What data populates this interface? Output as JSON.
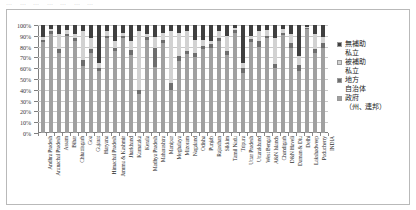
{
  "top_strip_text": "⋯ ⋯ ⋯ ⋯ ⋯ ⋯ ⋯",
  "legend": {
    "position": "right",
    "items": [
      {
        "label": "無補助\n私立",
        "color": "#3f3f3f",
        "name": "unaided-private"
      },
      {
        "label": "被補助\n私立",
        "color": "#d2d2d2",
        "name": "aided-private"
      },
      {
        "label": "地方\n自治体",
        "color": "#6e6e6e",
        "name": "local-body"
      },
      {
        "label": "政府\n（州、連邦）",
        "color": "#a0a0a0",
        "name": "government-state-union"
      }
    ]
  },
  "chart_data": {
    "type": "bar",
    "stacked": true,
    "normalized_percent": true,
    "title": "",
    "xlabel": "",
    "ylabel": "",
    "ylim": [
      0,
      100
    ],
    "grid": true,
    "ytick_labels": [
      "100%",
      "90%",
      "80%",
      "70%",
      "60%",
      "50%",
      "40%",
      "30%",
      "20%",
      "10%",
      "0%"
    ],
    "ytick_values": [
      100,
      90,
      80,
      70,
      60,
      50,
      40,
      30,
      20,
      10,
      0
    ],
    "series_order_bottom_to_top": [
      "政府（州、連邦）",
      "地方自治体",
      "被補助私立",
      "無補助私立"
    ],
    "categories": [
      "Andhra Pradesh",
      "Arunachal Pradesh",
      "Assam",
      "Bihar",
      "Chhattisgarh",
      "Goa",
      "Gujarat",
      "Haryana",
      "Himachal Pradesh",
      "Jammu & Kashmir",
      "Jharkhand",
      "Karnataka",
      "Kerala",
      "Madhya Pradesh",
      "Maharashtra",
      "Manipur",
      "Meghalaya",
      "Mizoram",
      "Nagaland",
      "Odisha",
      "Punjab",
      "Rajasthan",
      "Sikkim",
      "Tamil Nadu",
      "Tripura",
      "Uttar Pradesh",
      "Uttarakhand",
      "West Bengal",
      "A&N Islands",
      "Chandigarh",
      "D&N Haveli",
      "Daman & Diu",
      "Delhi",
      "Lakshadweep",
      "Puducherry",
      "INDIA"
    ],
    "series": [
      {
        "name": "政府（州、連邦）",
        "color": "#a0a0a0",
        "values": [
          84,
          92,
          74,
          90,
          85,
          62,
          74,
          57,
          88,
          76,
          88,
          72,
          36,
          86,
          61,
          83,
          40,
          67,
          73,
          70,
          78,
          79,
          85,
          72,
          93,
          56,
          84,
          80,
          88,
          60,
          91,
          79,
          57,
          96,
          74,
          79
        ]
      },
      {
        "name": "地方自治体",
        "color": "#6e6e6e",
        "values": [
          2,
          2,
          4,
          2,
          3,
          6,
          4,
          3,
          2,
          3,
          2,
          5,
          4,
          3,
          18,
          3,
          6,
          4,
          3,
          4,
          3,
          3,
          3,
          4,
          2,
          4,
          3,
          5,
          2,
          4,
          2,
          4,
          6,
          1,
          4,
          4
        ]
      },
      {
        "name": "被補助私立",
        "color": "#d2d2d2",
        "values": [
          3,
          2,
          14,
          3,
          4,
          26,
          10,
          5,
          4,
          6,
          3,
          8,
          54,
          3,
          10,
          7,
          48,
          22,
          18,
          12,
          5,
          3,
          6,
          14,
          2,
          5,
          3,
          9,
          5,
          24,
          3,
          9,
          8,
          1,
          14,
          6
        ]
      },
      {
        "name": "無補助私立",
        "color": "#3f3f3f",
        "values": [
          11,
          4,
          8,
          5,
          8,
          6,
          12,
          35,
          6,
          15,
          7,
          15,
          6,
          8,
          11,
          7,
          6,
          7,
          6,
          14,
          14,
          15,
          6,
          10,
          3,
          35,
          10,
          6,
          5,
          12,
          4,
          8,
          29,
          2,
          8,
          11
        ]
      }
    ]
  }
}
